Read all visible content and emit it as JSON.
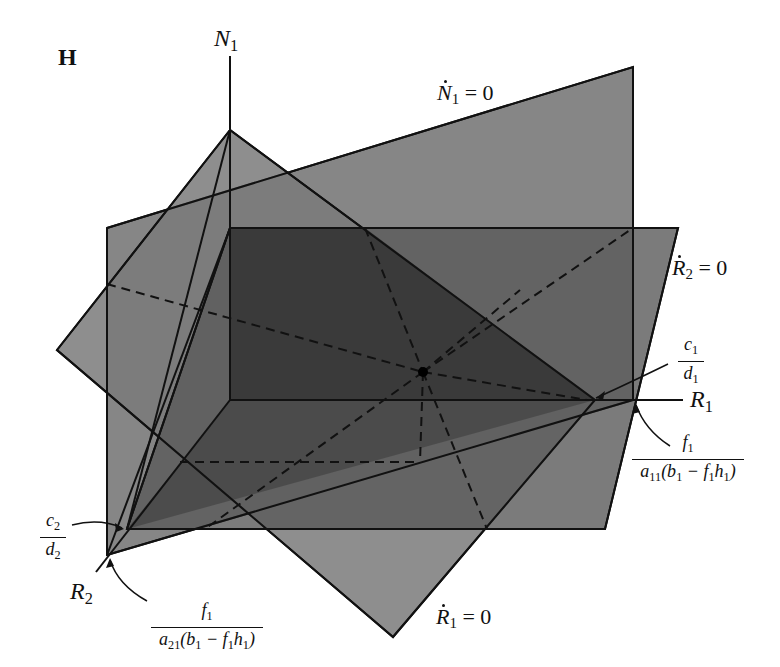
{
  "panel": {
    "letter": "H"
  },
  "axes": {
    "n1": {
      "label": "N",
      "sub": "1"
    },
    "r1": {
      "label": "R",
      "sub": "1"
    },
    "r2": {
      "label": "R",
      "sub": "2"
    }
  },
  "planes": {
    "n1_null": {
      "var": "N",
      "sub": "1",
      "rhs": " = 0",
      "fill": "#7d7d7d"
    },
    "r2_null": {
      "var": "R",
      "sub": "2",
      "rhs": " = 0",
      "fill": "#6a6a6a"
    },
    "r1_null": {
      "var": "R",
      "sub": "1",
      "rhs": " = 0",
      "fill": "#8c8c8c"
    }
  },
  "annotations": {
    "c1_d1": {
      "num": "c",
      "num_sub": "1",
      "den": "d",
      "den_sub": "1"
    },
    "c2_d2": {
      "num": "c",
      "num_sub": "2",
      "den": "d",
      "den_sub": "2"
    },
    "r1_intercept": {
      "num": "f",
      "num_sub": "1",
      "den_pre": "a",
      "den_pre_sub": "11",
      "den_mid": "(b",
      "den_mid_sub": "1",
      "den_rest": " − f",
      "den_rest_sub": "1",
      "den_h": "h",
      "den_h_sub": "1",
      "den_close": ")"
    },
    "r2_intercept": {
      "num": "f",
      "num_sub": "1",
      "den_pre": "a",
      "den_pre_sub": "21",
      "den_mid": "(b",
      "den_mid_sub": "1",
      "den_rest": " − f",
      "den_rest_sub": "1",
      "den_h": "h",
      "den_h_sub": "1",
      "den_close": ")"
    }
  },
  "colors": {
    "line": "#111111",
    "background": "#ffffff",
    "overlap_dark": "#2e2e2e"
  }
}
